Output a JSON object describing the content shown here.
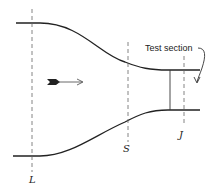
{
  "diagram": {
    "labels": {
      "L": "L",
      "S": "S",
      "J": "J",
      "test_section": "Test section"
    },
    "flow_direction": "left-to-right",
    "colors": {
      "stroke": "#222222",
      "dashed": "#555555",
      "background": "#ffffff"
    }
  }
}
